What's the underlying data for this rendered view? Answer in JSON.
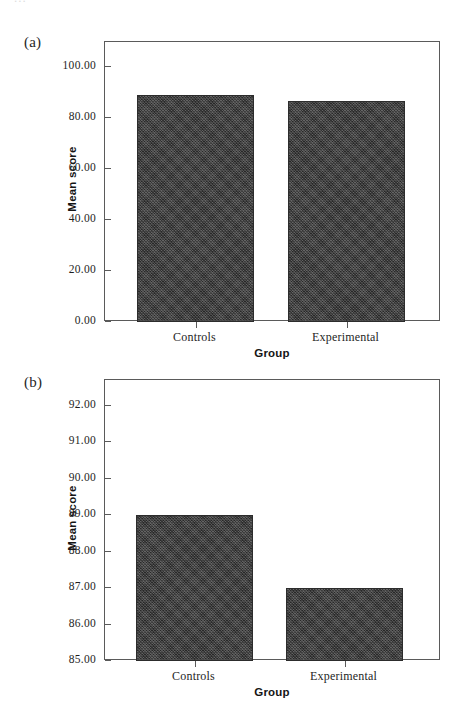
{
  "figure": {
    "background_color": "#ffffff",
    "bar_color": "#3b3b3b",
    "axis_color": "#5a5a5a",
    "top_bleed_text": "..."
  },
  "panels": [
    {
      "tag": "(a)",
      "ylabel": "Mean score",
      "xlabel": "Group",
      "categories": [
        "Controls",
        "Experimental"
      ],
      "yticks": [
        "0.00",
        "20.00",
        "40.00",
        "60.00",
        "80.00",
        "100.00"
      ]
    },
    {
      "tag": "(b)",
      "ylabel": "Mean score",
      "xlabel": "Group",
      "categories": [
        "Controls",
        "Experimental"
      ],
      "yticks": [
        "85.00",
        "86.00",
        "87.00",
        "88.00",
        "89.00",
        "90.00",
        "91.00",
        "92.00"
      ]
    }
  ],
  "chart_data": [
    {
      "type": "bar",
      "panel": "(a)",
      "title": "",
      "categories": [
        "Controls",
        "Experimental"
      ],
      "values": [
        89,
        87
      ],
      "xlabel": "Group",
      "ylabel": "Mean score",
      "ylim": [
        0,
        110
      ],
      "ytick_values": [
        0,
        20,
        40,
        60,
        80,
        100
      ],
      "ytick_labels": [
        "0.00",
        "20.00",
        "40.00",
        "60.00",
        "80.00",
        "100.00"
      ],
      "grid": false,
      "legend": false,
      "series": [
        {
          "name": "Mean score",
          "values": [
            89,
            87
          ]
        }
      ]
    },
    {
      "type": "bar",
      "panel": "(b)",
      "title": "",
      "categories": [
        "Controls",
        "Experimental"
      ],
      "values": [
        89,
        87
      ],
      "xlabel": "Group",
      "ylabel": "Mean score",
      "ylim": [
        85,
        92.7
      ],
      "ytick_values": [
        85,
        86,
        87,
        88,
        89,
        90,
        91,
        92
      ],
      "ytick_labels": [
        "85.00",
        "86.00",
        "87.00",
        "88.00",
        "89.00",
        "90.00",
        "91.00",
        "92.00"
      ],
      "grid": false,
      "legend": false,
      "series": [
        {
          "name": "Mean score",
          "values": [
            89,
            87
          ]
        }
      ]
    }
  ]
}
